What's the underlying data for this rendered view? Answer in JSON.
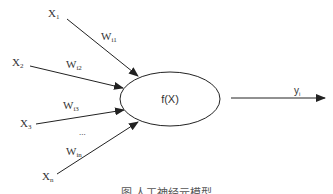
{
  "diagram": {
    "type": "artificial-neuron-model",
    "node": {
      "label": "f(X)"
    },
    "inputs": [
      {
        "label": "X",
        "sub": "1",
        "weight": "W",
        "weight_sub": "i1"
      },
      {
        "label": "X",
        "sub": "2",
        "weight": "W",
        "weight_sub": "i2"
      },
      {
        "label": "X",
        "sub": "3",
        "weight": "W",
        "weight_sub": "i3"
      },
      {
        "label": "X",
        "sub": "n",
        "weight": "W",
        "weight_sub": "in"
      }
    ],
    "ellipsis": "...",
    "output": {
      "label": "y",
      "sub": "i"
    },
    "caption": "图 人工神经元模型"
  }
}
